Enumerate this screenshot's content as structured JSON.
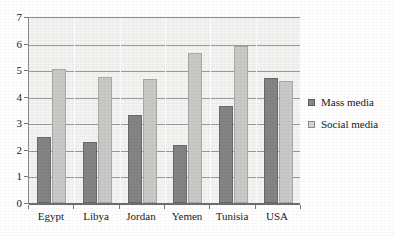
{
  "chart_data": {
    "type": "bar",
    "title": "",
    "subtitle": "",
    "xlabel": "",
    "ylabel": "",
    "categories": [
      "Egypt",
      "Libya",
      "Jordan",
      "Yemen",
      "Tunisia",
      "USA"
    ],
    "series": [
      {
        "name": "Mass media",
        "color": "#848484",
        "values": [
          2.5,
          2.3,
          3.3,
          2.2,
          3.65,
          4.7
        ]
      },
      {
        "name": "Social media",
        "color": "#c9c9c7",
        "values": [
          5.05,
          4.75,
          4.65,
          5.65,
          5.9,
          4.6
        ]
      }
    ],
    "ylim": [
      0,
      7
    ],
    "ytick_labels": [
      "0",
      "1",
      "2",
      "3",
      "4",
      "5",
      "6",
      "7"
    ],
    "ytick_values": [
      0,
      1,
      2,
      3,
      4,
      5,
      6,
      7
    ],
    "grid": true,
    "grid_axis": "y",
    "legend_position": "right",
    "plot_background": "#f3f3f2"
  },
  "legend": {
    "items": [
      {
        "label": "Mass media"
      },
      {
        "label": "Social media"
      }
    ]
  }
}
